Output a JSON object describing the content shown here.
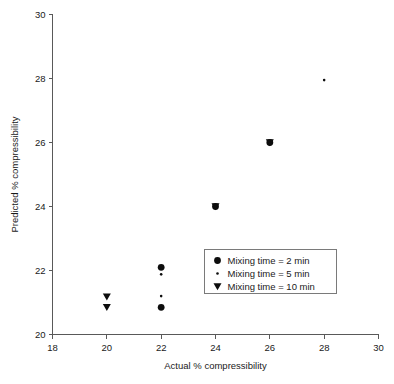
{
  "chart_data": {
    "type": "scatter",
    "title": "",
    "xlabel": "Actual % compressibility",
    "ylabel": "Predicted % compressibility",
    "xlim": [
      18,
      30
    ],
    "ylim": [
      20,
      30
    ],
    "xticks": [
      18,
      20,
      22,
      24,
      26,
      28,
      30
    ],
    "xtick_labels": [
      "18",
      "20",
      "22",
      "24",
      "26",
      "28",
      "30"
    ],
    "yticks": [
      20,
      22,
      24,
      26,
      28,
      30
    ],
    "ytick_labels": [
      "20",
      "22",
      "24",
      "26",
      "28",
      "30"
    ],
    "grid": false,
    "legend_position": "center-right-inside",
    "series": [
      {
        "name": "Mixing time = 2 min",
        "marker": "filled-circle",
        "color": "#0d0d0d",
        "points": [
          {
            "x": 22,
            "y": 22.1
          },
          {
            "x": 22,
            "y": 20.85
          },
          {
            "x": 24,
            "y": 24.0
          },
          {
            "x": 26,
            "y": 26.0
          }
        ]
      },
      {
        "name": "Mixing time = 5 min",
        "marker": "small-dot",
        "color": "#0d0d0d",
        "points": [
          {
            "x": 22,
            "y": 21.88
          },
          {
            "x": 22,
            "y": 21.2
          },
          {
            "x": 28,
            "y": 27.95
          }
        ]
      },
      {
        "name": "Mixing time = 10 min",
        "marker": "filled-triangle-down",
        "color": "#0d0d0d",
        "points": [
          {
            "x": 20,
            "y": 21.18
          },
          {
            "x": 20,
            "y": 20.85
          },
          {
            "x": 24,
            "y": 24.0
          },
          {
            "x": 26,
            "y": 26.0
          }
        ]
      }
    ]
  },
  "legend": {
    "entries": [
      {
        "label": "Mixing time = 2 min",
        "marker": "filled-circle"
      },
      {
        "label": "Mixing time = 5 min",
        "marker": "small-dot"
      },
      {
        "label": "Mixing time = 10 min",
        "marker": "filled-triangle-down"
      }
    ]
  }
}
